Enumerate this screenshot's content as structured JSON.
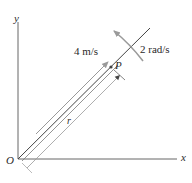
{
  "diagram": {
    "axes": {
      "x_label": "x",
      "y_label": "y",
      "origin_label": "O"
    },
    "rod": {
      "point_label": "P",
      "distance_label": "r",
      "velocity_label": "4 m/s",
      "angular_velocity_label": "2 rad/s"
    },
    "colors": {
      "line": "#555555",
      "arrow_gray": "#999999",
      "text": "#2a2a2a"
    }
  }
}
